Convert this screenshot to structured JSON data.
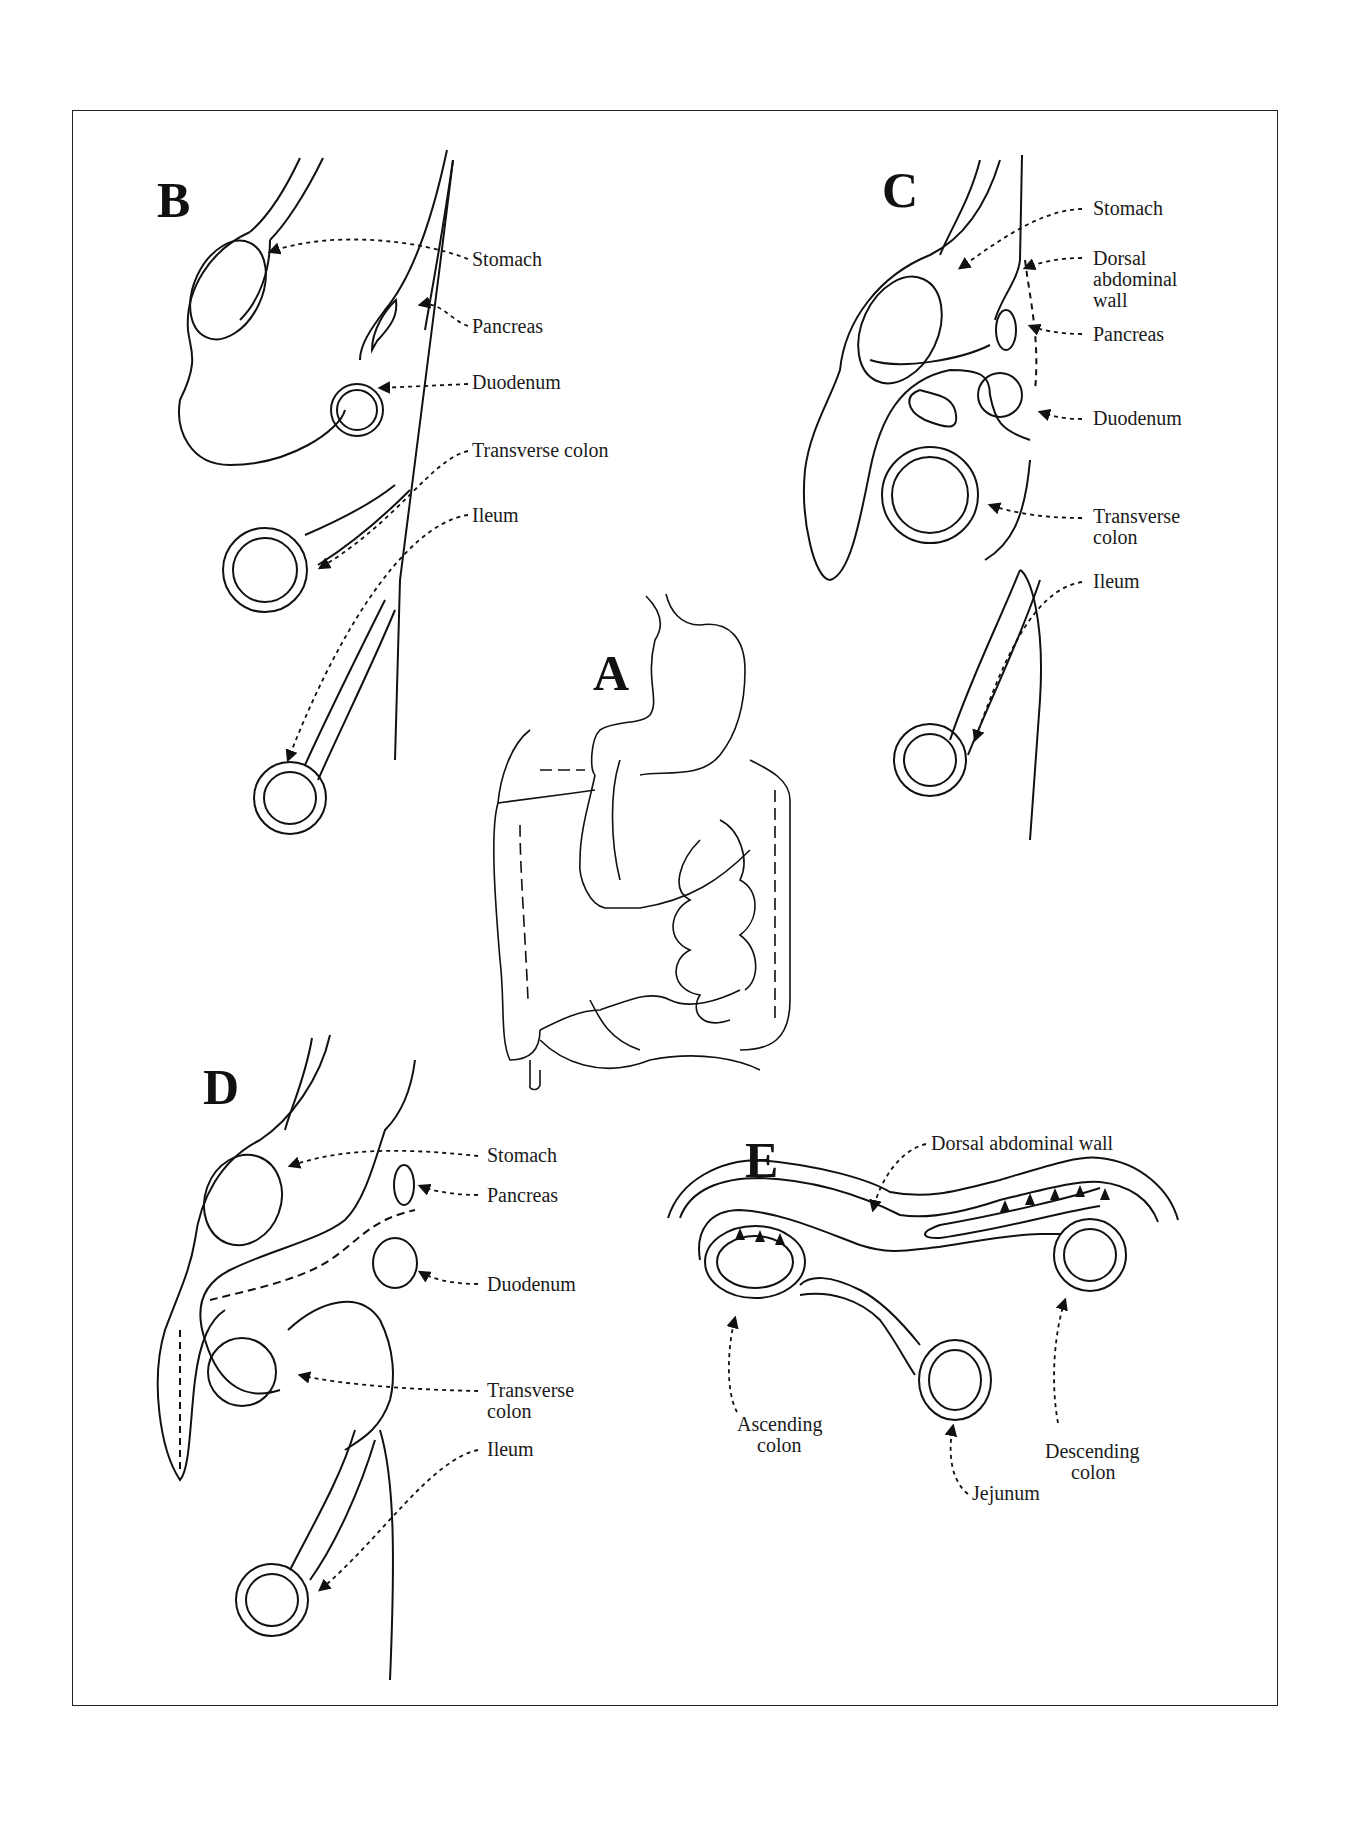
{
  "figure": {
    "panels": {
      "A": {
        "letter": "A",
        "description": "Overview drawing of stomach, small intestine and colon"
      },
      "B": {
        "letter": "B",
        "labels": [
          "Stomach",
          "Pancreas",
          "Duodenum",
          "Transverse colon",
          "Ileum"
        ]
      },
      "C": {
        "letter": "C",
        "labels": [
          "Stomach",
          "Dorsal abdominal wall",
          "Pancreas",
          "Duodenum",
          "Transverse colon",
          "Ileum"
        ]
      },
      "D": {
        "letter": "D",
        "labels": [
          "Stomach",
          "Pancreas",
          "Duodenum",
          "Transverse colon",
          "Ileum"
        ]
      },
      "E": {
        "letter": "E",
        "labels": [
          "Dorsal abdominal wall",
          "Ascending colon",
          "Jejunum",
          "Descending colon"
        ]
      }
    },
    "B": {
      "stomach": "Stomach",
      "pancreas": "Pancreas",
      "duodenum": "Duodenum",
      "transverse_colon": "Transverse colon",
      "ileum": "Ileum"
    },
    "C": {
      "stomach": "Stomach",
      "dorsal_1": "Dorsal",
      "dorsal_2": "abdominal",
      "dorsal_3": "wall",
      "pancreas": "Pancreas",
      "duodenum": "Duodenum",
      "transverse_1": "Transverse",
      "transverse_2": "colon",
      "ileum": "Ileum"
    },
    "D": {
      "stomach": "Stomach",
      "pancreas": "Pancreas",
      "duodenum": "Duodenum",
      "transverse_1": "Transverse",
      "transverse_2": "colon",
      "ileum": "Ileum"
    },
    "E": {
      "dorsal": "Dorsal abdominal wall",
      "ascending_1": "Ascending",
      "ascending_2": "colon",
      "jejunum": "Jejunum",
      "descending_1": "Descending",
      "descending_2": "colon"
    }
  }
}
